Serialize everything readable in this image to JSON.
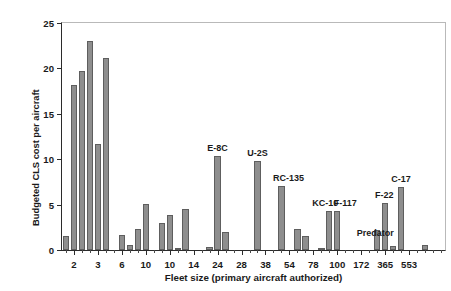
{
  "chart_data": {
    "type": "bar",
    "title": "",
    "subtitle": "",
    "xlabel": "Fleet size (primary aircraft authorized)",
    "ylabel_lines": [
      "Budgeted CLS cost per aircraft",
      "in FY 2008 ($ millions)"
    ],
    "ylabel": "Budgeted CLS cost per aircraft in FY 2008 ($ millions)",
    "ylim": [
      0,
      25
    ],
    "ytick_values": [
      0,
      5,
      10,
      15,
      20,
      25
    ],
    "ytick_labels": [
      "0",
      "5",
      "10",
      "15",
      "20",
      "25"
    ],
    "grid": false,
    "legend": null,
    "bar_color": "#8e8e8e",
    "bar_edge_color": "#5e5e5e",
    "axis_color": "#2b2b2b",
    "n_bars": 48,
    "xtick_labels": [
      "2",
      "3",
      "6",
      "10",
      "10",
      "14",
      "24",
      "28",
      "38",
      "54",
      "78",
      "100",
      "172",
      "365",
      "553"
    ],
    "xtick_label_bar_index": [
      1,
      4,
      7,
      10,
      13,
      16,
      19,
      22,
      25,
      28,
      31,
      34,
      37,
      40,
      43
    ],
    "categories": [
      "2",
      "2",
      "2",
      "2",
      "3",
      "3",
      "3",
      "3",
      "6",
      "6",
      "6",
      "6",
      "10",
      "10",
      "10",
      "10",
      "10",
      "10",
      "10",
      "14",
      "14",
      "14",
      "24",
      "24",
      "24",
      "28",
      "28",
      "28",
      "38",
      "38",
      "38",
      "54",
      "54",
      "54",
      "78",
      "78",
      "78",
      "100",
      "100",
      "100",
      "172",
      "172",
      "172",
      "365",
      "365",
      "365",
      "553",
      "553"
    ],
    "values": [
      1.5,
      18.2,
      19.7,
      23.0,
      11.7,
      21.2,
      0.0,
      1.6,
      0.5,
      2.3,
      5.1,
      0.0,
      3.0,
      3.9,
      0.1,
      4.5,
      0.0,
      0.0,
      0.3,
      10.3,
      2.0,
      0.0,
      0.0,
      0.0,
      9.8,
      0.0,
      0.0,
      7.0,
      0.0,
      2.3,
      1.5,
      0.0,
      0.2,
      4.3,
      4.3,
      0.0,
      0.0,
      0.0,
      0.0,
      2.2,
      5.2,
      0.4,
      6.9,
      0.0,
      0.0,
      0.5,
      0.0,
      0.0
    ],
    "annotations": [
      {
        "label": "E-8C",
        "bar_index": 19,
        "value": 10.3
      },
      {
        "label": "U-2S",
        "bar_index": 24,
        "value": 9.8
      },
      {
        "label": "RC-135",
        "bar_index": 27,
        "value": 7.0
      },
      {
        "label": "KC-10",
        "bar_index": 33,
        "value": 4.3
      },
      {
        "label": "F-117",
        "bar_index": 34,
        "value": 4.3
      },
      {
        "label": "Predator",
        "bar_index": 39,
        "value": 2.2
      },
      {
        "label": "F-22",
        "bar_index": 40,
        "value": 5.2
      },
      {
        "label": "C-17",
        "bar_index": 42,
        "value": 6.9
      }
    ]
  }
}
